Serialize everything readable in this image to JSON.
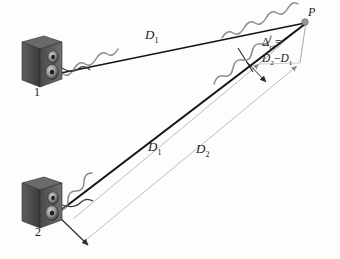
{
  "figure": {
    "background_color": "#fdfdfd",
    "ray_color": "#141414",
    "wave_color": "#8c8c8c",
    "dimension_color": "#b0b0b0",
    "speaker_body_color": "#454545",
    "speaker_front_color": "#6d6d6d"
  },
  "labels": {
    "point_p": "P",
    "d1_top": "D",
    "d1_top_sub": "1",
    "d1_bottom": "D",
    "d1_bottom_sub": "1",
    "d2_bottom": "D",
    "d2_bottom_sub": "2",
    "delta_symbol": "Δ",
    "delta_sub": "pl",
    "delta_equals": "=",
    "delta_expr_first": "D",
    "delta_expr_first_sub": "2",
    "delta_expr_minus": "−",
    "delta_expr_second": "D",
    "delta_expr_second_sub": "1",
    "speaker_1": "1",
    "speaker_2": "2"
  },
  "elements": {
    "speaker_1_name": "loudspeaker-1",
    "speaker_2_name": "loudspeaker-2",
    "ray_1_name": "sound-ray-from-speaker-1",
    "ray_2_name": "sound-ray-from-speaker-2",
    "wave_1_name": "sine-wave-on-ray-1",
    "wave_2_name": "sine-wave-on-ray-2",
    "dim_d1_name": "dimension-line-d1",
    "dim_d2_name": "dimension-line-d2",
    "delta_segment_name": "path-length-difference-segment",
    "point_p_marker_name": "point-p-marker"
  },
  "geometry": {
    "point_p": [
      306,
      22
    ],
    "speaker_1_emit": [
      58,
      72
    ],
    "speaker_2_emit": [
      58,
      213
    ]
  }
}
